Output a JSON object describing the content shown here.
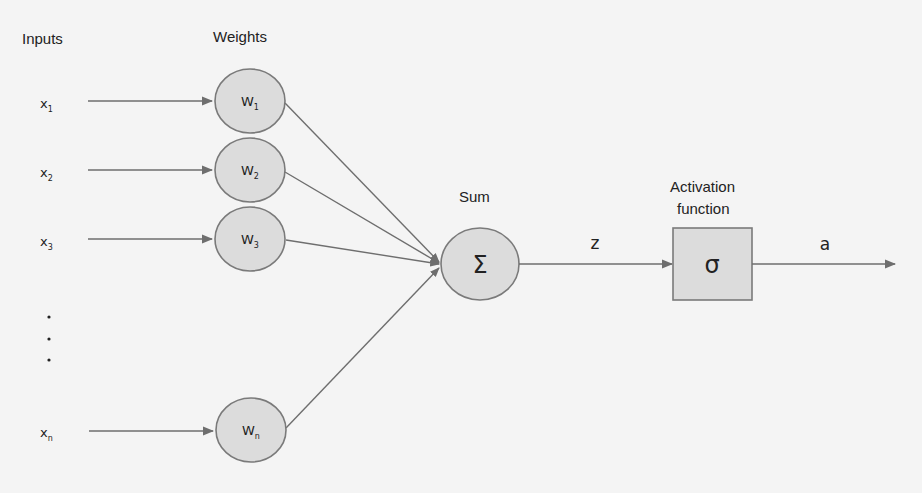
{
  "diagram": {
    "type": "perceptron",
    "headings": {
      "inputs": "Inputs",
      "weights": "Weights",
      "sum": "Sum",
      "activation_line1": "Activation",
      "activation_line2": "function"
    },
    "inputs": [
      {
        "base": "x",
        "sub": "1"
      },
      {
        "base": "x",
        "sub": "2"
      },
      {
        "base": "x",
        "sub": "3"
      },
      {
        "base": "x",
        "sub": "n"
      }
    ],
    "weights": [
      {
        "base": "W",
        "sub": "1"
      },
      {
        "base": "W",
        "sub": "2"
      },
      {
        "base": "W",
        "sub": "3"
      },
      {
        "base": "W",
        "sub": "n"
      }
    ],
    "ellipsis": [
      "•",
      "•",
      "•"
    ],
    "sum_symbol": "Σ",
    "activation_symbol": "σ",
    "edge_labels": {
      "z": "z",
      "a": "a"
    },
    "colors": {
      "node_fill": "#dcdcdc",
      "node_stroke": "#7a7a7a",
      "edge": "#6e6e6e",
      "background": "#f4f4f4"
    }
  }
}
